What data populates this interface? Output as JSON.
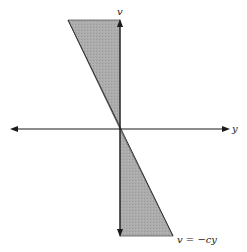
{
  "diagram": {
    "axes": {
      "horizontal_label": "y",
      "vertical_label": "v"
    },
    "line_label": "v = −cy",
    "shaded_regions": [
      "upper-left wedge between v-axis and line v = -cy",
      "lower-right wedge between v-axis and line v = -cy"
    ],
    "colors": {
      "shade": "#a9a9a9",
      "axis": "#1a1a1a"
    }
  }
}
